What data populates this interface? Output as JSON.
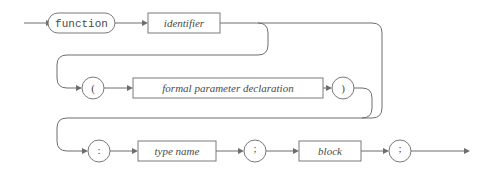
{
  "diagram": {
    "type": "railroad-syntax-diagram",
    "rule_name": "function declaration",
    "colors": {
      "background": "#ffffff",
      "rail": "#6d6d6d",
      "node_stroke": "#7a7a7a",
      "node_fill": "#ffffff",
      "text": "#4a4a4a"
    },
    "rows": [
      {
        "index": 1,
        "y": 23,
        "nodes": [
          {
            "id": "function-keyword",
            "label": "function",
            "shape": "stadium",
            "kind": "terminal",
            "font": "mono",
            "x": 48,
            "width": 67,
            "height": 20
          },
          {
            "id": "identifier",
            "label": "identifier",
            "shape": "rect",
            "kind": "nonterminal",
            "font": "italic-serif",
            "x": 148,
            "width": 72,
            "height": 20
          }
        ]
      },
      {
        "index": 2,
        "y": 88,
        "nodes": [
          {
            "id": "open-paren",
            "label": "(",
            "shape": "circle",
            "kind": "terminal",
            "font": "serif",
            "x": 93,
            "radius": 11
          },
          {
            "id": "formal-parameter-declaration",
            "label": "formal parameter declaration",
            "shape": "rect",
            "kind": "nonterminal",
            "font": "italic-serif",
            "x": 133,
            "width": 190,
            "height": 20
          },
          {
            "id": "close-paren",
            "label": ")",
            "shape": "circle",
            "kind": "terminal",
            "font": "serif",
            "x": 343,
            "radius": 11
          }
        ]
      },
      {
        "index": 3,
        "y": 151,
        "nodes": [
          {
            "id": "colon",
            "label": ":",
            "shape": "circle",
            "kind": "terminal",
            "font": "serif",
            "x": 99,
            "radius": 11
          },
          {
            "id": "type-name",
            "label": "type name",
            "shape": "rect",
            "kind": "nonterminal",
            "font": "italic-serif",
            "x": 138,
            "width": 78,
            "height": 20
          },
          {
            "id": "semicolon-1",
            "label": ";",
            "shape": "circle",
            "kind": "terminal",
            "font": "serif",
            "x": 255,
            "radius": 11
          },
          {
            "id": "block",
            "label": "block",
            "shape": "rect",
            "kind": "nonterminal",
            "font": "italic-serif",
            "x": 299,
            "width": 62,
            "height": 20
          },
          {
            "id": "semicolon-2",
            "label": ";",
            "shape": "circle",
            "kind": "terminal",
            "font": "serif",
            "x": 400,
            "radius": 11
          }
        ]
      }
    ],
    "entry": {
      "label": "entry-arrow",
      "x_start": 24,
      "x_end": 48,
      "y": 23
    },
    "exit": {
      "label": "exit-arrow",
      "x_start": 411,
      "x_end": 470,
      "y": 151
    }
  }
}
